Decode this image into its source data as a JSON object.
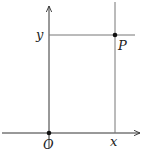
{
  "diagram": {
    "origin_label": "O",
    "x_label": "x",
    "y_label": "y",
    "point_label": "P",
    "colors": {
      "axis": "#333333",
      "guide": "#777777",
      "point": "#111111"
    }
  }
}
